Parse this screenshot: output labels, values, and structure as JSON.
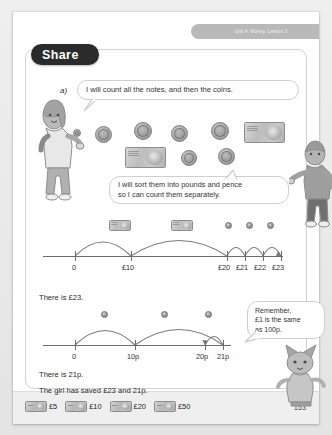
{
  "running_head": "Unit 4: Money, Lesson 3",
  "section": {
    "title": "Share",
    "part_label": "a)"
  },
  "speech_bubbles": [
    {
      "id": "girl-notes-coins",
      "text": "I will count all the notes, and then the coins."
    },
    {
      "id": "boy-sort",
      "line1": "I will sort them into pounds and pence",
      "line2": "so I can count them separately."
    },
    {
      "id": "cat-remember",
      "line1": "Remember,",
      "line2": "£1 is the same",
      "line3": "as 100p."
    }
  ],
  "characters": [
    {
      "name": "girl",
      "alt": "girl character pointing"
    },
    {
      "name": "boy",
      "alt": "boy character"
    },
    {
      "name": "cat",
      "alt": "cat character"
    }
  ],
  "money_set": {
    "coins": [
      "coin",
      "coin",
      "coin",
      "coin",
      "coin",
      "coin",
      "coin"
    ],
    "notes": [
      "note",
      "note"
    ]
  },
  "number_lines": [
    {
      "id": "pounds",
      "tick_labels": [
        "0",
        "£10",
        "£20",
        "£21",
        "£22",
        "£23"
      ],
      "jump_icons": [
        "note",
        "note",
        "coin",
        "coin",
        "coin"
      ],
      "result_sentence": "There is £23."
    },
    {
      "id": "pence",
      "tick_labels": [
        "0",
        "10p",
        "20p",
        "21p"
      ],
      "jump_icons": [
        "coin",
        "coin",
        "coin"
      ],
      "result_sentence": "There is 21p."
    }
  ],
  "conclusion": "The girl has saved £23 and 21p.",
  "footer": {
    "money_key": [
      {
        "icon": "banknote-icon",
        "label": "£5"
      },
      {
        "icon": "banknote-icon",
        "label": "£10"
      },
      {
        "icon": "banknote-icon",
        "label": "£20"
      },
      {
        "icon": "banknote-icon",
        "label": "£50"
      }
    ],
    "page_number": "153"
  },
  "colors": {
    "page_background": "#ffffff",
    "outer_background": "#e9e9e9",
    "pill_background": "#2b2b2b",
    "runhead_background": "#b9b9b9",
    "line_stroke": "#6d6d6d",
    "footer_background": "#efefef"
  }
}
